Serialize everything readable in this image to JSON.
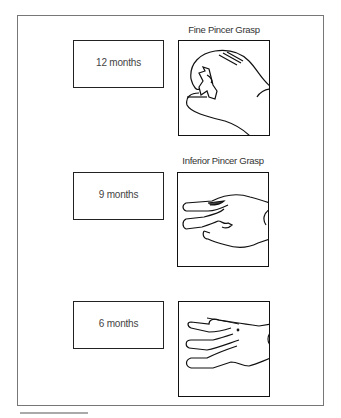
{
  "figure": {
    "stages": [
      {
        "age_label": "12 months",
        "caption": "Fine Pincer Grasp",
        "illustration": "hand-fine-pincer-grasp"
      },
      {
        "age_label": "9 months",
        "caption": "Inferior Pincer Grasp",
        "illustration": "hand-inferior-pincer-grasp"
      },
      {
        "age_label": "6 months",
        "caption": "",
        "illustration": "hand-raking-grasp"
      }
    ]
  }
}
